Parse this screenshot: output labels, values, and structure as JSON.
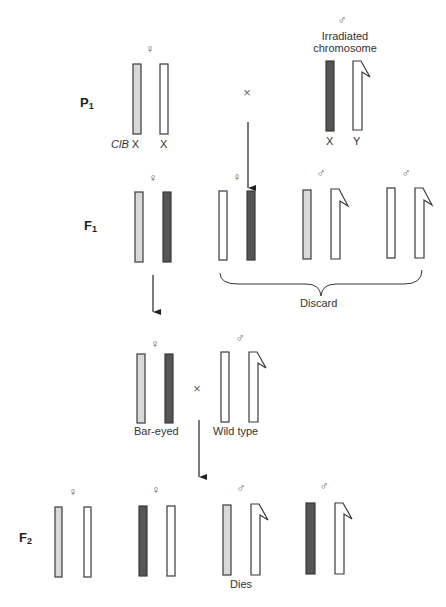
{
  "colors": {
    "clb_chromosome": "#d9d9d9",
    "irradiated_chromosome": "#555555",
    "normal_chromosome": "#ffffff",
    "outline": "#3a3a3a"
  },
  "generations": {
    "p1": {
      "label": "P",
      "sub": "1"
    },
    "f1": {
      "label": "F",
      "sub": "1"
    },
    "f2": {
      "label": "F",
      "sub": "2"
    }
  },
  "symbols": {
    "female": "♀",
    "male": "♂",
    "cross": "×"
  },
  "p1": {
    "female": {
      "left_label_italic": "ClB",
      "left_label": "X",
      "right_label": "X"
    },
    "male": {
      "caption_line1": "Irradiated",
      "caption_line2": "chromosome",
      "left_label": "X",
      "right_label": "Y"
    }
  },
  "f1": {
    "discard_label": "Discard"
  },
  "cross2": {
    "female_label": "Bar-eyed",
    "male_label": "Wild type"
  },
  "f2": {
    "dies_label": "Dies"
  },
  "chromosome_key": [
    {
      "type": "ClB X",
      "fill": "light-gray"
    },
    {
      "type": "Irradiated X",
      "fill": "dark-gray"
    },
    {
      "type": "Normal X",
      "fill": "white"
    },
    {
      "type": "Y",
      "fill": "white-hooked"
    }
  ]
}
